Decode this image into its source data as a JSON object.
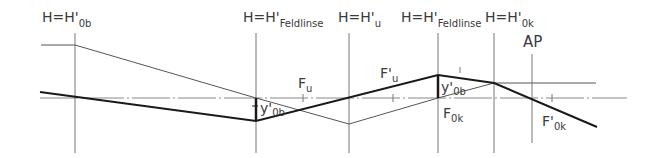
{
  "diagram": {
    "type": "optical-ray-diagram",
    "colors": {
      "line": "#555555",
      "thick_ray": "#1a1a1a",
      "axis": "#888888",
      "text": "#3a3a3a"
    },
    "planes": [
      {
        "id": "H0b",
        "label_main": "H=H",
        "label_prime": "'",
        "label_sub": "0b",
        "x": 75
      },
      {
        "id": "Feldlinse1",
        "label_main": "H=H",
        "label_prime": "'",
        "label_sub": "Feldlinse",
        "x": 256
      },
      {
        "id": "Hu",
        "label_main": "H=H",
        "label_prime": "'",
        "label_sub": "u",
        "x": 349
      },
      {
        "id": "Feldlinse2",
        "label_main": "H=H",
        "label_prime": "'",
        "label_sub": "Feldlinse",
        "x": 438
      },
      {
        "id": "H0k",
        "label_main": "H=H",
        "label_prime": "'",
        "label_sub": "0k",
        "x": 494
      },
      {
        "id": "AP",
        "label_main": "AP",
        "x": 532
      }
    ],
    "focal_points": [
      {
        "id": "Fu",
        "label_main": "F",
        "label_sub": "u",
        "x": 303
      },
      {
        "id": "Fu_prime",
        "label_main": "F'",
        "label_sub": "u",
        "x": 393
      },
      {
        "id": "F0k",
        "label_main": "F",
        "label_sub": "0k",
        "x": 438
      },
      {
        "id": "F0k_prime",
        "label_main": "F'",
        "label_sub": "0k",
        "x": 552
      }
    ],
    "image_labels": [
      {
        "id": "y0b_1",
        "label_main": "y'",
        "label_sub": "0b"
      },
      {
        "id": "y0b_2",
        "label_main": "y'",
        "label_sub": "0b"
      }
    ]
  }
}
